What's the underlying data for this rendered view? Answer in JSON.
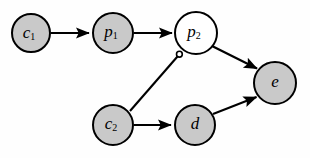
{
  "diagram": {
    "background_color": "#fefefe",
    "node_fill_color": "#c9c9c9",
    "node_open_fill_color": "#ffffff",
    "stroke_color": "#000000",
    "nodes": [
      {
        "id": "c1",
        "base": "c",
        "sub": "1",
        "cx": 31,
        "cy": 33,
        "r": 19,
        "fill": "gray"
      },
      {
        "id": "p1",
        "base": "p",
        "sub": "1",
        "cx": 113,
        "cy": 33,
        "r": 20,
        "fill": "gray"
      },
      {
        "id": "p2",
        "base": "p",
        "sub": "2",
        "cx": 196,
        "cy": 33,
        "r": 21,
        "fill": "white"
      },
      {
        "id": "c2",
        "base": "c",
        "sub": "2",
        "cx": 113,
        "cy": 125,
        "r": 20,
        "fill": "gray"
      },
      {
        "id": "d",
        "base": "d",
        "sub": "",
        "cx": 195,
        "cy": 125,
        "r": 20,
        "fill": "gray"
      },
      {
        "id": "e",
        "base": "e",
        "sub": "",
        "cx": 275,
        "cy": 83,
        "r": 21,
        "fill": "gray"
      }
    ],
    "edges": [
      {
        "id": "c1-p1",
        "from": "c1",
        "to": "p1",
        "x1": 51,
        "y1": 33,
        "x2": 91,
        "y2": 33,
        "head": "arrow"
      },
      {
        "id": "p1-p2",
        "from": "p1",
        "to": "p2",
        "x1": 134,
        "y1": 33,
        "x2": 174,
        "y2": 33,
        "head": "arrow"
      },
      {
        "id": "p2-e",
        "from": "p2",
        "to": "e",
        "x1": 212,
        "y1": 46,
        "x2": 260,
        "y2": 70,
        "head": "arrow"
      },
      {
        "id": "d-e",
        "from": "d",
        "to": "e",
        "x1": 213,
        "y1": 114,
        "x2": 259,
        "y2": 96,
        "head": "arrow"
      },
      {
        "id": "c2-d",
        "from": "c2",
        "to": "d",
        "x1": 134,
        "y1": 125,
        "x2": 173,
        "y2": 125,
        "head": "arrow"
      },
      {
        "id": "c2-p2",
        "from": "c2",
        "to": "p2",
        "x1": 130,
        "y1": 111,
        "x2": 177,
        "y2": 57,
        "head": "blunt-circle"
      }
    ],
    "inhibitor_marker": {
      "cx": 179,
      "cy": 54,
      "r": 2.8
    }
  }
}
